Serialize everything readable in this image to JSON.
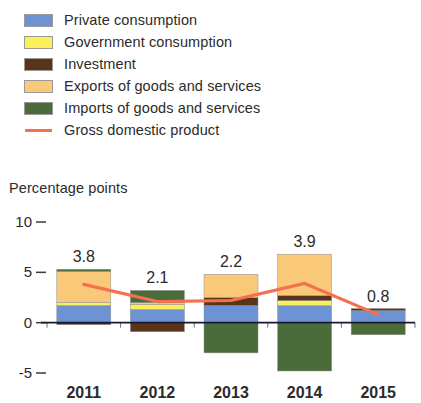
{
  "legend": {
    "items": [
      {
        "label": "Private consumption",
        "color": "#6d93d4",
        "type": "swatch",
        "icon": "color-swatch-icon"
      },
      {
        "label": "Government consumption",
        "color": "#faf05a",
        "type": "swatch",
        "icon": "color-swatch-icon"
      },
      {
        "label": "Investment",
        "color": "#5a3418",
        "type": "swatch",
        "icon": "color-swatch-icon"
      },
      {
        "label": "Exports of goods and services",
        "color": "#f9c979",
        "type": "swatch",
        "icon": "color-swatch-icon"
      },
      {
        "label": "Imports of goods and services",
        "color": "#4a6b3a",
        "type": "swatch",
        "icon": "color-swatch-icon"
      },
      {
        "label": "Gross domestic product",
        "color": "#f4714f",
        "type": "line",
        "icon": "line-sample-icon"
      }
    ]
  },
  "axis_title": "Percentage points",
  "chart_data": {
    "type": "bar",
    "subtype": "stacked-bar-with-line-overlay",
    "title": "",
    "subtitle": "",
    "xlabel": "",
    "ylabel": "Percentage points",
    "ylim": [
      -5,
      10
    ],
    "yticks": [
      10,
      5,
      0,
      -5
    ],
    "ytick_labels": [
      "10",
      "5",
      "0",
      "-5"
    ],
    "grid": false,
    "legend_position": "top-left",
    "categories": [
      "2011",
      "2012",
      "2013",
      "2014",
      "2015"
    ],
    "series": [
      {
        "name": "Private consumption",
        "color": "#6d93d4",
        "values": [
          1.7,
          1.3,
          1.7,
          1.7,
          1.2
        ]
      },
      {
        "name": "Government consumption",
        "color": "#faf05a",
        "values": [
          0.3,
          0.5,
          0.0,
          0.5,
          0.0
        ]
      },
      {
        "name": "Investment",
        "color": "#5a3418",
        "values": [
          -0.2,
          -0.9,
          0.8,
          0.5,
          0.2
        ]
      },
      {
        "name": "Exports of goods and services",
        "color": "#f9c979",
        "values": [
          3.1,
          0.2,
          2.3,
          4.1,
          0.0
        ]
      },
      {
        "name": "Imports of goods and services",
        "color": "#4a6b3a",
        "values": [
          0.2,
          1.2,
          -3.0,
          -4.8,
          -1.2
        ]
      }
    ],
    "overlay_series": {
      "name": "Gross domestic product",
      "color": "#f4714f",
      "type": "line",
      "values": [
        3.8,
        2.1,
        2.2,
        3.9,
        0.8
      ]
    },
    "bar_labels": [
      "3.8",
      "2.1",
      "2.2",
      "3.9",
      "0.8"
    ],
    "annotations": []
  }
}
